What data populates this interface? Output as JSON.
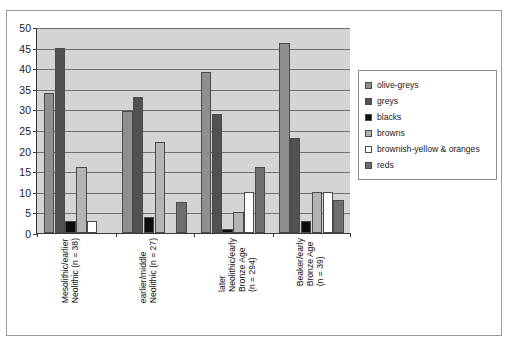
{
  "chart_data": {
    "type": "bar",
    "title": "",
    "subtitle": "",
    "xlabel": "",
    "ylabel": "",
    "ylim": [
      0,
      50
    ],
    "yticks": [
      0,
      5,
      10,
      15,
      20,
      25,
      30,
      35,
      40,
      45,
      50
    ],
    "ytick_labels": [
      "0",
      "5",
      "10",
      "15",
      "20",
      "25",
      "30",
      "35",
      "40",
      "45",
      "50"
    ],
    "grid": true,
    "legend_position": "right",
    "categories": [
      "Mesolithic/earlier Neolithic (n = 38)",
      "earlier/middle Neolithic (n = 27)",
      "later Neolithic/early Bronze Age (n = 294)",
      "Beaker/early Bronze Age (n = 39)"
    ],
    "category_lines": [
      [
        "Mesolithic/earlier",
        "Neolithic (n = 38)"
      ],
      [
        "earlier/middle",
        "Neolithic (n = 27)"
      ],
      [
        "later",
        "Neolithic/early",
        "Bronze Age",
        "(n = 294)"
      ],
      [
        "Beaker/early",
        "Bronze Age",
        "(n = 39)"
      ]
    ],
    "series": [
      {
        "name": "olive-greys",
        "color": "#8f8f8f",
        "values": [
          34,
          29.5,
          39,
          46
        ]
      },
      {
        "name": "greys",
        "color": "#515151",
        "values": [
          45,
          33,
          29,
          23
        ]
      },
      {
        "name": "blacks",
        "color": "#0d0d0d",
        "values": [
          3,
          4,
          1,
          3
        ]
      },
      {
        "name": "browns",
        "color": "#b4b4b4",
        "values": [
          16,
          22,
          5,
          10
        ]
      },
      {
        "name": "brownish-yellow & oranges",
        "color": "#ffffff",
        "values": [
          3,
          0,
          10,
          10
        ]
      },
      {
        "name": "reds",
        "color": "#6e6e6e",
        "values": [
          0,
          7.5,
          16,
          8
        ]
      }
    ]
  },
  "legend": {
    "items": [
      {
        "label": "olive-greys",
        "color": "#8f8f8f"
      },
      {
        "label": "greys",
        "color": "#515151"
      },
      {
        "label": "blacks",
        "color": "#0d0d0d"
      },
      {
        "label": "browns",
        "color": "#b4b4b4"
      },
      {
        "label": "brownish-yellow & oranges",
        "color": "#ffffff"
      },
      {
        "label": "reds",
        "color": "#6e6e6e"
      }
    ]
  },
  "colors": {
    "plot_background": "#d4d4d4",
    "figure_background": "#ffffff",
    "gridline": "#6f6f6f",
    "axis": "#3a3a3a",
    "frame": "#9a9a9a"
  }
}
